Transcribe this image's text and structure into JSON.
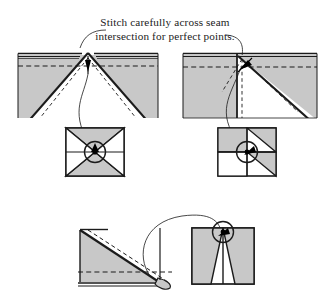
{
  "figure": {
    "kind": "quilting-instruction-diagram",
    "title_caption": {
      "line1": "Stitch carefully across seam",
      "line2": "intersection for perfect points."
    },
    "colors": {
      "fabric_fill": "#c8c8c8",
      "fabric_fill_light": "#d5d5d5",
      "outline": "#1b1b1b",
      "dashed_seam": "#1b1b1b",
      "background": "#ffffff",
      "marker": "#000000"
    },
    "panels": [
      {
        "id": "panel-top-left",
        "name": "hourglass-unit-stitching-detail",
        "description": "Two fabric pieces layered with an hourglass point meeting at the top raw edge; dashed seam allowance line runs horizontally, dashed stitching lines converge at the point.",
        "marker": "stitch-point-arrow",
        "inset": {
          "name": "hourglass-block-inset",
          "pattern": "hourglass-four-triangle-square",
          "highlight": "circled-center-intersection"
        }
      },
      {
        "id": "panel-top-right",
        "name": "half-square-unit-stitching-detail",
        "description": "Layered fabric with a diagonal seam meeting the vertical seam at the top; dashed seam allowance line crosses horizontally.",
        "marker": "stitch-point-arrow",
        "inset": {
          "name": "pinwheel-block-inset",
          "pattern": "quartered-square-with-diagonals",
          "highlight": "circled-center-intersection"
        }
      },
      {
        "id": "panel-bottom",
        "name": "flying-geese-unit-stitching-detail",
        "description": "Folded triangle unit with dashed stitching line along the diagonal and a dashed seam allowance line near the lower edge.",
        "marker": "stitch-point-arrow",
        "inset": {
          "name": "flying-geese-block-inset",
          "pattern": "two-peak-triangle-square",
          "highlight": "circled-top-intersection"
        }
      }
    ],
    "annotations": {
      "leader_lines": [
        "caption-to-left-point",
        "caption-to-right-point",
        "left-point-to-inset",
        "right-point-to-inset",
        "bottom-unit-to-inset"
      ]
    }
  }
}
